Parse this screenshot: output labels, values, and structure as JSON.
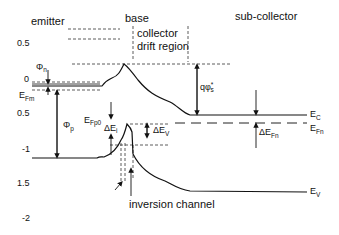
{
  "diagram": {
    "type": "energy band diagram",
    "regions": {
      "emitter": "emitter",
      "base": "base",
      "collector_line1": "collector",
      "collector_line2": "drift region",
      "subcollector": "sub-collector"
    },
    "y_axis_ticks": [
      "0.5",
      "0",
      "0.5",
      "-1",
      "1.5",
      "-2"
    ],
    "labels": {
      "phi_n": "Φ",
      "phi_n_sub": "n",
      "E_Fm": "E",
      "E_Fm_sub": "Fm",
      "phi_p": "Φ",
      "phi_p_sub": "p",
      "E_Fp0": "E",
      "E_Fp0_sub": "Fp0",
      "delta_Ei": "ΔE",
      "delta_Ei_sub": "i",
      "delta_Ev": "ΔE",
      "delta_Ev_sub": "V",
      "q_phi_s": "qφ",
      "q_phi_s_sub": "s",
      "q_phi_s_sup": "*",
      "E_C": "E",
      "E_C_sub": "C",
      "E_Fn": "E",
      "E_Fn_sub": "Fn",
      "delta_EFn": "ΔE",
      "delta_EFn_sub": "Fn",
      "E_V": "E",
      "E_V_sub": "V",
      "inversion_channel": "inversion channel"
    },
    "colors": {
      "line": "#111111",
      "background": "#ffffff"
    }
  }
}
